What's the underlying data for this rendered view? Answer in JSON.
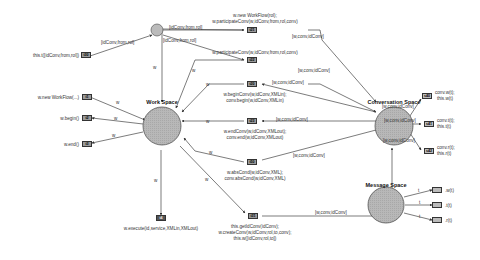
{
  "spaces": {
    "work": {
      "title": "Work Space"
    },
    "conversation": {
      "title": "Conversation Space"
    },
    "message": {
      "title": "Message Space"
    }
  },
  "transitions": {
    "t30": {
      "id": "t30",
      "label": "this.t([idConv,from,rol])"
    },
    "t1": {
      "id": "t1",
      "label": "w.new WorkFlow(...)"
    },
    "t2": {
      "id": "t2",
      "label": "w.begin()"
    },
    "t3": {
      "id": "t3",
      "label": "w.end()"
    },
    "t4": {
      "id": "t4",
      "label": "w.execute(id,service,XMLin,XMLout)"
    },
    "t21": {
      "id": "t21",
      "line1": "w.new WorkFlow(rol);",
      "line2": "w.participateConv(w,idConv,from,rol,conv)"
    },
    "t22": {
      "id": "t22",
      "line1": "w.participateConv(w,idConv,from,rol,conv)"
    },
    "t20": {
      "id": "t20",
      "line1": "w.beginConv(w,idConv,XMLin);",
      "line2": "conv.begin(w,idConv,XMLin)"
    },
    "t23": {
      "id": "t23",
      "line1": "w.endConv(w,idConv,XMLout);",
      "line2": "conv.end(w,idConv,XMLout)"
    },
    "t50": {
      "id": "t50",
      "line1": "w.absCond(w,idConv,XML);",
      "line2": "conv.absCond(w,idConv,XML)"
    },
    "t31": {
      "id": "t31",
      "line1": "this.getIdConv(idConv);",
      "line2": "w.createConv(w,idConv,rol,to,conv);",
      "line3": "this.w([idConv,rol,to])"
    },
    "s40": {
      "id": "s40",
      "line1": "conv.w(t);",
      "line2": "this.w(t)"
    },
    "s41": {
      "id": "s41",
      "line1": "conv.t(t);",
      "line2": "this.t(t)"
    },
    "s42": {
      "id": "s42",
      "line1": "conv.r(t);",
      "line2": "this.r(t)"
    },
    "m1": {
      "label": ".w(t)"
    },
    "m2": {
      "label": ".t(t)"
    },
    "m3": {
      "label": ".r(t)"
    }
  },
  "arc_labels": {
    "w": "w",
    "t": "t",
    "idconv_from_rol": "[idConv,from,rol]",
    "w_conv_idconv": "[w,conv,idConv]"
  }
}
